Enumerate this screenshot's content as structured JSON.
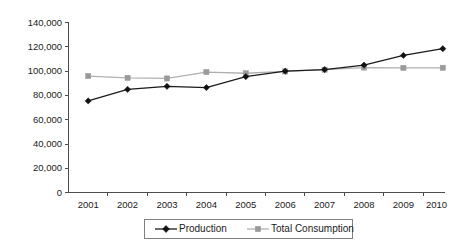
{
  "chart_data": {
    "type": "line",
    "title": "",
    "subtitle": "",
    "xlabel": "",
    "ylabel": "",
    "categories": [
      "2001",
      "2002",
      "2003",
      "2004",
      "2005",
      "2006",
      "2007",
      "2008",
      "2009",
      "2010"
    ],
    "series": [
      {
        "name": "Production",
        "color": "#1a1a1a",
        "marker": "diamond",
        "values": [
          75000,
          84500,
          87000,
          86000,
          95000,
          99500,
          100800,
          104500,
          112500,
          118000
        ]
      },
      {
        "name": "Total Consumption",
        "color": "#b0b0b0",
        "marker": "square",
        "values": [
          95500,
          94000,
          93500,
          98800,
          97800,
          99300,
          100700,
          102500,
          102200,
          102300
        ]
      }
    ],
    "ylim": [
      0,
      140000
    ],
    "ytick_values": [
      0,
      20000,
      40000,
      60000,
      80000,
      100000,
      120000,
      140000
    ],
    "ytick_labels": [
      "0",
      "20,000",
      "40,000",
      "60,000",
      "80,000",
      "100,000",
      "120,000",
      "140,000"
    ],
    "xtick_labels": [
      "2001",
      "2002",
      "2003",
      "2004",
      "2005",
      "2006",
      "2007",
      "2008",
      "2009",
      "2010"
    ],
    "grid": false,
    "legend_position": "bottom-center",
    "legend_entries": [
      "Production",
      "Total Consumption"
    ],
    "background_color": "#ffffff",
    "axis_color": "#4d4d4d"
  }
}
